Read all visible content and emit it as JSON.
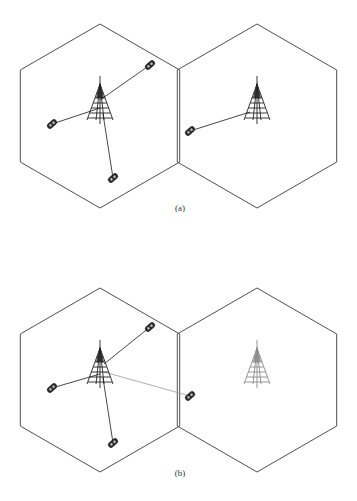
{
  "colors": {
    "hex_stroke": "#3a3a3a",
    "link": "#333333",
    "interference_link": "#9a9a9a",
    "tower_dark": "#222222",
    "tower_light": "#8a8a8a",
    "phone": "#2a2a2a"
  },
  "panels": [
    {
      "caption": "(a)",
      "caption_pos": {
        "x": 180,
        "y": 203
      },
      "offset_y": 0,
      "cells": [
        {
          "name": "left-cell",
          "center": [
            100,
            116
          ],
          "tower": [
            100,
            100
          ],
          "tower_style": "dark"
        },
        {
          "name": "right-cell",
          "center": [
            257,
            116
          ],
          "tower": [
            257,
            100
          ],
          "tower_style": "dark"
        }
      ],
      "phones": [
        {
          "pos": [
            150,
            65
          ],
          "link_to": [
            100,
            100
          ],
          "style": "dark"
        },
        {
          "pos": [
            52,
            124
          ],
          "link_to": [
            100,
            108
          ],
          "style": "dark"
        },
        {
          "pos": [
            113,
            178
          ],
          "link_to": [
            103,
            114
          ],
          "style": "dark"
        },
        {
          "pos": [
            190,
            131
          ],
          "link_to": [
            250,
            112
          ],
          "style": "dark"
        }
      ]
    },
    {
      "caption": "(b)",
      "caption_pos": {
        "x": 180,
        "y": 468
      },
      "offset_y": 0,
      "cells": [
        {
          "name": "left-cell",
          "center": [
            100,
            380
          ],
          "tower": [
            100,
            364
          ],
          "tower_style": "dark"
        },
        {
          "name": "right-cell",
          "center": [
            257,
            380
          ],
          "tower": [
            257,
            364
          ],
          "tower_style": "light"
        }
      ],
      "phones": [
        {
          "pos": [
            150,
            327
          ],
          "link_to": [
            104,
            364
          ],
          "style": "dark"
        },
        {
          "pos": [
            52,
            388
          ],
          "link_to": [
            100,
            374
          ],
          "style": "dark"
        },
        {
          "pos": [
            113,
            443
          ],
          "link_to": [
            103,
            378
          ],
          "style": "dark"
        },
        {
          "pos": [
            190,
            396
          ],
          "link_to": [
            104,
            372
          ],
          "style": "light"
        }
      ]
    }
  ]
}
